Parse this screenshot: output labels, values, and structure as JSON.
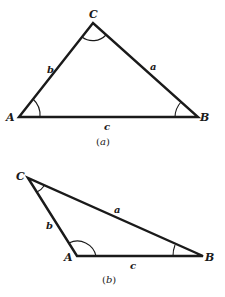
{
  "figure": {
    "triangle_a": {
      "vertices": {
        "A": {
          "label": "A",
          "x": 19,
          "y": 117
        },
        "B": {
          "label": "B",
          "x": 198,
          "y": 117
        },
        "C": {
          "label": "C",
          "x": 93,
          "y": 23
        }
      },
      "sides": {
        "a": "a",
        "b": "b",
        "c": "c"
      },
      "caption_open": "(",
      "caption_letter": "a",
      "caption_close": ")"
    },
    "triangle_b": {
      "vertices": {
        "A": {
          "label": "A",
          "x": 77,
          "y": 256
        },
        "B": {
          "label": "B",
          "x": 203,
          "y": 256
        },
        "C": {
          "label": "C",
          "x": 28,
          "y": 178
        }
      },
      "sides": {
        "a": "a",
        "b": "b",
        "c": "c"
      },
      "caption_open": "(",
      "caption_letter": "b",
      "caption_close": ")"
    },
    "colors": {
      "stroke": "#1a1a1a",
      "background": "#ffffff"
    }
  }
}
